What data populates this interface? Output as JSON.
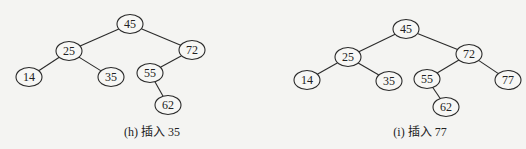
{
  "figures": [
    {
      "id": "h",
      "caption": "(h) 插入 35",
      "caption_pos": {
        "x": 152,
        "y": 122
      },
      "nodes": [
        {
          "key": "45",
          "x": 130,
          "y": 24
        },
        {
          "key": "25",
          "x": 69,
          "y": 51
        },
        {
          "key": "72",
          "x": 192,
          "y": 50
        },
        {
          "key": "14",
          "x": 29,
          "y": 77
        },
        {
          "key": "35",
          "x": 111,
          "y": 77
        },
        {
          "key": "55",
          "x": 150,
          "y": 73
        },
        {
          "key": "62",
          "x": 168,
          "y": 105
        }
      ],
      "edges": [
        [
          "45",
          "25"
        ],
        [
          "45",
          "72"
        ],
        [
          "25",
          "14"
        ],
        [
          "25",
          "35"
        ],
        [
          "72",
          "55"
        ],
        [
          "55",
          "62"
        ]
      ]
    },
    {
      "id": "i",
      "caption": "(i) 插入 77",
      "caption_pos": {
        "x": 420,
        "y": 122
      },
      "nodes": [
        {
          "key": "45",
          "x": 406,
          "y": 29
        },
        {
          "key": "25",
          "x": 348,
          "y": 57
        },
        {
          "key": "72",
          "x": 469,
          "y": 54
        },
        {
          "key": "14",
          "x": 307,
          "y": 80
        },
        {
          "key": "35",
          "x": 389,
          "y": 81
        },
        {
          "key": "55",
          "x": 427,
          "y": 79
        },
        {
          "key": "77",
          "x": 508,
          "y": 80
        },
        {
          "key": "62",
          "x": 446,
          "y": 107
        }
      ],
      "edges": [
        [
          "45",
          "25"
        ],
        [
          "45",
          "72"
        ],
        [
          "25",
          "14"
        ],
        [
          "25",
          "35"
        ],
        [
          "72",
          "55"
        ],
        [
          "72",
          "77"
        ],
        [
          "55",
          "62"
        ]
      ]
    }
  ],
  "node_rx": 13,
  "node_ry": 9.5
}
